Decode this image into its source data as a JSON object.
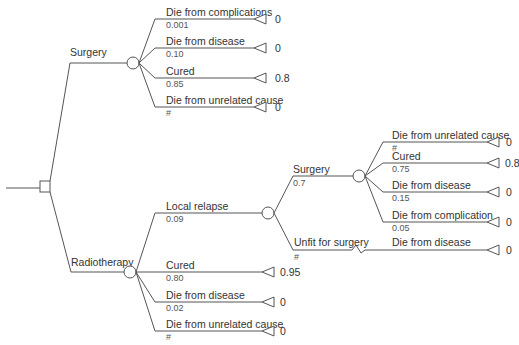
{
  "diagram": {
    "type": "decision-tree",
    "decision_node": {
      "id": "root"
    },
    "options": [
      {
        "label": "Surgery",
        "chance_node": {
          "branches": [
            {
              "label": "Die from complications",
              "prob": "0.001",
              "payoff": "0"
            },
            {
              "label": "Die from disease",
              "prob": "0.10",
              "payoff": "0"
            },
            {
              "label": "Cured",
              "prob": "0.85",
              "payoff": "0.8"
            },
            {
              "label": "Die from unrelated cause",
              "prob": "#",
              "payoff": "0"
            }
          ]
        }
      },
      {
        "label": "Radiotherapy",
        "chance_node": {
          "branches": [
            {
              "label": "Local relapse",
              "prob": "0.09",
              "sub": {
                "surgery": {
                  "label": "Surgery",
                  "prob": "0.7",
                  "branches": [
                    {
                      "label": "Die from unrelated cause",
                      "prob": "#",
                      "payoff": "0"
                    },
                    {
                      "label": "Cured",
                      "prob": "0.75",
                      "payoff": "0.8"
                    },
                    {
                      "label": "Die from disease",
                      "prob": "0.15",
                      "payoff": "0"
                    },
                    {
                      "label": "Die from complication",
                      "prob": "0.05",
                      "payoff": "0"
                    }
                  ]
                },
                "unfit": {
                  "label": "Unfit for surgery",
                  "prob": "#",
                  "outcome_label": "Die from disease",
                  "payoff": "0"
                }
              }
            },
            {
              "label": "Cured",
              "prob": "0.80",
              "payoff": "0.95"
            },
            {
              "label": "Die from disease",
              "prob": "0.02",
              "payoff": "0"
            },
            {
              "label": "Die from unrelated cause",
              "prob": "#",
              "payoff": "0"
            }
          ]
        }
      }
    ]
  }
}
